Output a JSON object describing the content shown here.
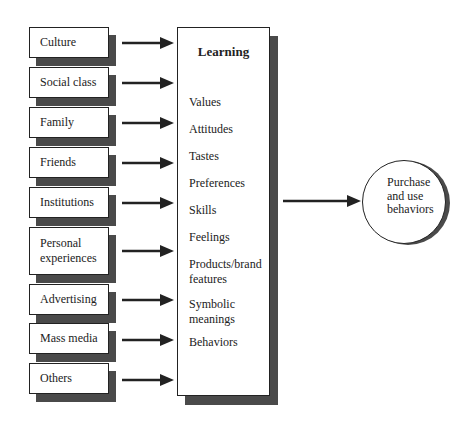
{
  "sources": [
    {
      "label": "Culture"
    },
    {
      "label": "Social class"
    },
    {
      "label": "Family"
    },
    {
      "label": "Friends"
    },
    {
      "label": "Institutions"
    },
    {
      "label": "Personal experiences"
    },
    {
      "label": "Advertising"
    },
    {
      "label": "Mass media"
    },
    {
      "label": "Others"
    }
  ],
  "learning": {
    "title": "Learning",
    "items": [
      "Values",
      "Attitudes",
      "Tastes",
      "Preferences",
      "Skills",
      "Feelings",
      "Products/brand features",
      "Symbolic meanings",
      "Behaviors"
    ]
  },
  "outcome": {
    "label": "Purchase and use behaviors"
  },
  "colors": {
    "line": "#222222",
    "shadow": "#4a4a4a",
    "fill": "#ffffff"
  }
}
